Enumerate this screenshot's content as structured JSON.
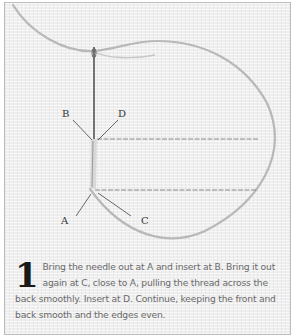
{
  "illustration": {
    "labels": {
      "a": "A",
      "b": "B",
      "c": "C",
      "d": "D"
    },
    "colors": {
      "fabric": "#efefef",
      "thread": "#b5b5b5",
      "stitch": "#808080",
      "needle": "#555555"
    }
  },
  "caption": {
    "step_number": "1",
    "text": "Bring the needle out at A and insert at B. Bring it out again at C, close to A, pulling the thread across the back smoothly. Insert at D. Continue, keeping the front and back smooth and the edges even."
  }
}
